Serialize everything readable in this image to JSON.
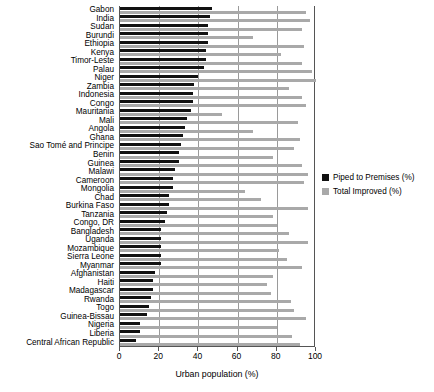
{
  "chart_data": {
    "type": "bar",
    "orientation": "horizontal",
    "title": "",
    "xlabel": "Urban population (%)",
    "ylabel": "",
    "xlim": [
      0,
      100
    ],
    "xticks": [
      0,
      20,
      40,
      60,
      80,
      100
    ],
    "grid": true,
    "legend_position": "right",
    "categories": [
      "Gabon",
      "India",
      "Sudan",
      "Burundi",
      "Ethiopia",
      "Kenya",
      "Timor-Leste",
      "Palau",
      "Niger",
      "Zambia",
      "Indonesia",
      "Congo",
      "Mauritania",
      "Mali",
      "Angola",
      "Ghana",
      "Sao Tomé and Principe",
      "Benin",
      "Guinea",
      "Malawi",
      "Cameroon",
      "Mongolia",
      "Chad",
      "Burkina Faso",
      "Tanzania",
      "Congo, DR",
      "Bangladesh",
      "Uganda",
      "Mozambique",
      "Sierra Leone",
      "Myanmar",
      "Afghanistan",
      "Haiti",
      "Madagascar",
      "Rwanda",
      "Togo",
      "Guinea-Bissau",
      "Nigeria",
      "Liberia",
      "Central African Republic"
    ],
    "series": [
      {
        "name": "Piped to Premises (%)",
        "color": "#111111",
        "values": [
          47,
          46,
          45,
          45,
          45,
          44,
          44,
          43,
          40,
          38,
          37,
          37,
          36,
          34,
          33,
          32,
          31,
          30,
          30,
          28,
          27,
          27,
          25,
          25,
          24,
          23,
          21,
          21,
          21,
          21,
          21,
          18,
          17,
          17,
          16,
          15,
          14,
          10,
          10,
          8
        ]
      },
      {
        "name": "Total Improved (%)",
        "color": "#a9a9a9",
        "values": [
          95,
          97,
          93,
          68,
          94,
          82,
          93,
          98,
          100,
          86,
          93,
          95,
          52,
          91,
          68,
          92,
          89,
          78,
          93,
          96,
          94,
          64,
          72,
          96,
          78,
          80,
          86,
          96,
          81,
          85,
          93,
          78,
          75,
          77,
          87,
          89,
          95,
          80,
          88,
          92
        ]
      }
    ]
  },
  "legend": {
    "items": [
      {
        "label": "Piped to Premises (%)",
        "color": "#111111"
      },
      {
        "label": "Total Improved (%)",
        "color": "#a9a9a9"
      }
    ]
  }
}
